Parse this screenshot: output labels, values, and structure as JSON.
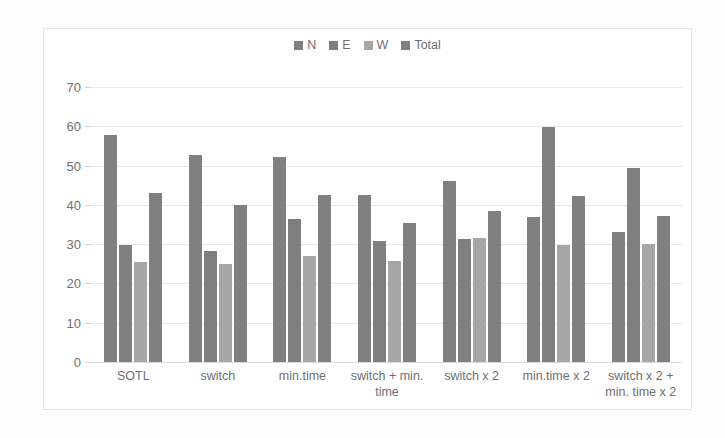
{
  "chart_data": {
    "type": "bar",
    "title": "",
    "subtitle": "",
    "xlabel": "",
    "ylabel": "",
    "ylim": [
      0,
      70
    ],
    "y_ticks": [
      0,
      10,
      20,
      30,
      40,
      50,
      60,
      70
    ],
    "grid": true,
    "legend_position": "top-center",
    "categories": [
      "SOTL",
      "switch",
      "min.time",
      "switch + min. time",
      "switch x 2",
      "min.time x 2",
      "switch x 2 + min. time x 2"
    ],
    "series": [
      {
        "name": "N",
        "color": "#808080",
        "values": [
          57.8,
          52.7,
          52.2,
          42.4,
          46.0,
          37.0,
          33.0
        ]
      },
      {
        "name": "E",
        "color": "#7f7f7f",
        "values": [
          29.7,
          28.2,
          36.5,
          30.9,
          31.2,
          59.9,
          49.5
        ]
      },
      {
        "name": "W",
        "color": "#a6a6a6",
        "values": [
          25.5,
          24.9,
          27.0,
          25.7,
          31.6,
          29.8,
          30.0
        ]
      },
      {
        "name": "Total",
        "color": "#808080",
        "values": [
          43.0,
          39.9,
          42.4,
          35.3,
          38.5,
          42.2,
          37.1
        ]
      }
    ]
  },
  "colors": {
    "plot_background": "#ffffff",
    "page_background": "#fdfdfd",
    "border": "#e4e4e4",
    "gridline": "#e9e9e9",
    "axis_text": "#6f6f6f",
    "series_dark": "#808080",
    "series_light": "#a6a6a6"
  }
}
